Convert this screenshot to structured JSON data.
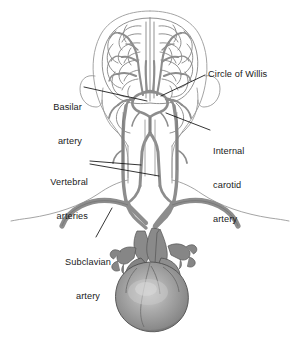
{
  "figure": {
    "view": "posterior",
    "background_color": "#ffffff",
    "colors": {
      "artery_fill": "#8d8d8d",
      "artery_fill_light": "#9e9e9e",
      "artery_outline": "#4a4a4a",
      "body_outline": "#9a9a9a",
      "brain_outline": "#7d7d7d",
      "heart_fill": "#8a8a8a",
      "heart_highlight": "#c9c9c9",
      "heart_outline": "#4f4f4f",
      "leader_line": "#111111",
      "label_text": "#1a1a1a"
    },
    "structures": [
      {
        "name": "head-outline",
        "label": "Head outline"
      },
      {
        "name": "brain",
        "label": "Brain"
      },
      {
        "name": "ear-left",
        "label": "Left ear"
      },
      {
        "name": "ear-right",
        "label": "Right ear"
      },
      {
        "name": "neck-shoulders",
        "label": "Neck and shoulders"
      },
      {
        "name": "circle-of-willis",
        "label": "Circle of Willis"
      },
      {
        "name": "basilar-artery",
        "label": "Basilar artery"
      },
      {
        "name": "vertebral-arteries",
        "label": "Vertebral arteries"
      },
      {
        "name": "internal-carotid-arteries",
        "label": "Internal carotid arteries"
      },
      {
        "name": "subclavian-arteries",
        "label": "Subclavian arteries"
      },
      {
        "name": "aortic-arch",
        "label": "Aortic arch"
      },
      {
        "name": "heart",
        "label": "Heart"
      }
    ]
  },
  "labels": {
    "circle_of_willis": {
      "text": "Circle of Willis",
      "lines": [
        "Circle of Willis"
      ],
      "side": "right"
    },
    "basilar_artery": {
      "text": "Basilar artery",
      "lines": [
        "Basilar",
        "artery"
      ],
      "side": "left"
    },
    "internal_carotid_artery": {
      "text": "Internal carotid artery",
      "lines": [
        "Internal",
        "carotid",
        "artery"
      ],
      "side": "right"
    },
    "vertebral_arteries": {
      "text": "Vertebral arteries",
      "lines": [
        "Vertebral",
        "arteries"
      ],
      "side": "left"
    },
    "subclavian_artery": {
      "text": "Subclavian artery",
      "lines": [
        "Subclavian",
        "artery"
      ],
      "side": "left"
    }
  }
}
